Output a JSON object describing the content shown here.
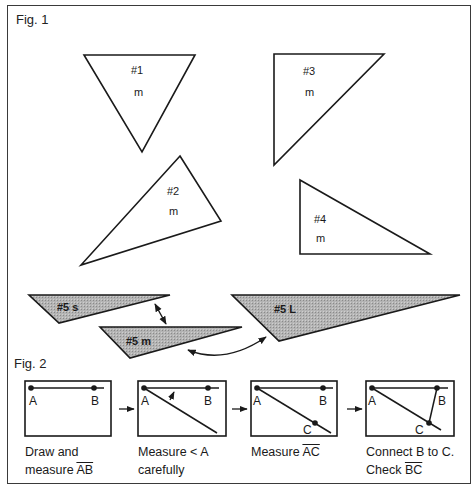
{
  "fig1": {
    "label": "Fig. 1",
    "triangles": [
      {
        "id": "#1",
        "size": "m"
      },
      {
        "id": "#2",
        "size": "m"
      },
      {
        "id": "#3",
        "size": "m"
      },
      {
        "id": "#4",
        "size": "m"
      }
    ],
    "shaded": [
      {
        "label": "#5 s"
      },
      {
        "label": "#5 m"
      },
      {
        "label": "#5 L"
      }
    ],
    "colors": {
      "stroke": "#1a1a1a",
      "shade": "#a8a8a8",
      "background": "#ffffff"
    }
  },
  "fig2": {
    "label": "Fig. 2",
    "points": {
      "a": "A",
      "b": "B",
      "c": "C"
    },
    "steps": [
      {
        "line1": "Draw and",
        "line2_prefix": "measure ",
        "line2_over": "AB"
      },
      {
        "line1": "Measure < A",
        "line2": "carefully"
      },
      {
        "line1_prefix": "Measure ",
        "line1_over": "AC"
      },
      {
        "line1": "Connect B to C.",
        "line2_prefix": "Check ",
        "line2_over": "BC"
      }
    ]
  }
}
